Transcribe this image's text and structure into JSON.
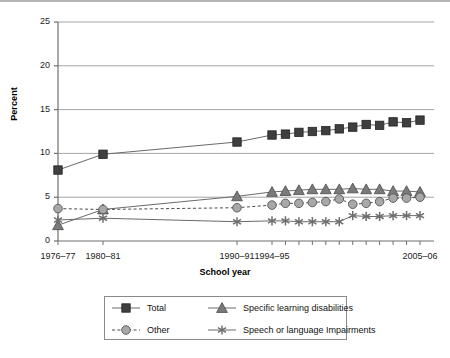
{
  "chart_data": {
    "type": "line",
    "title": "",
    "subtitle": "",
    "xlabel": "School year",
    "ylabel": "Percent",
    "ylim": [
      0,
      25
    ],
    "yticks": [
      0,
      5,
      10,
      15,
      20,
      25
    ],
    "grid": true,
    "legend_position": "bottom",
    "categories": [
      "1976-77",
      "1980-81",
      "1990-91",
      "1994-95",
      "1995-96",
      "1996-97",
      "1997-98",
      "1998-99",
      "1999-2000",
      "2000-01",
      "2001-02",
      "2002-03",
      "2003-04",
      "2004-05",
      "2005-06"
    ],
    "xtick_labels": [
      "1976–77",
      "1980–81",
      "1990–91",
      "1994–95",
      "2005–06"
    ],
    "xtick_label_positions": [
      0,
      1,
      2,
      3,
      14
    ],
    "series": [
      {
        "name": "Total",
        "marker": "square",
        "linestyle": "solid",
        "color": "#3f3f3f",
        "values": [
          8.1,
          9.9,
          11.3,
          12.1,
          12.2,
          12.4,
          12.5,
          12.6,
          12.8,
          13.0,
          13.3,
          13.2,
          13.6,
          13.5,
          13.8
        ]
      },
      {
        "name": "Specific learning disabilities",
        "marker": "triangle",
        "linestyle": "solid",
        "color": "#7a7a7a",
        "values": [
          1.8,
          3.6,
          5.1,
          5.6,
          5.7,
          5.8,
          5.9,
          5.9,
          5.9,
          6.0,
          5.9,
          5.9,
          5.7,
          5.7,
          5.6
        ]
      },
      {
        "name": "Other",
        "marker": "circle",
        "linestyle": "dashed",
        "color": "#a8a8a8",
        "values": [
          3.7,
          3.6,
          3.8,
          4.1,
          4.3,
          4.3,
          4.4,
          4.5,
          4.8,
          4.2,
          4.3,
          4.5,
          4.9,
          4.9,
          5.0
        ]
      },
      {
        "name": "Speech or language Impairments",
        "marker": "star",
        "linestyle": "solid",
        "color": "#6e6e6e",
        "values": [
          2.4,
          2.6,
          2.2,
          2.3,
          2.3,
          2.2,
          2.2,
          2.2,
          2.2,
          2.9,
          2.8,
          2.8,
          2.9,
          2.9,
          2.9
        ]
      }
    ]
  },
  "legend": {
    "items": [
      {
        "label": "Total",
        "marker": "square",
        "linestyle": "solid",
        "color": "#3f3f3f"
      },
      {
        "label": "Specific learning disabilities",
        "marker": "triangle",
        "linestyle": "solid",
        "color": "#7a7a7a"
      },
      {
        "label": "Other",
        "marker": "circle",
        "linestyle": "dashed",
        "color": "#a8a8a8"
      },
      {
        "label": "Speech or language Impairments",
        "marker": "star",
        "linestyle": "solid",
        "color": "#6e6e6e"
      }
    ]
  },
  "colors": {
    "axis": "#6f6f6f",
    "grid": "#9a9a9a",
    "text": "#111111",
    "background": "#ffffff"
  }
}
